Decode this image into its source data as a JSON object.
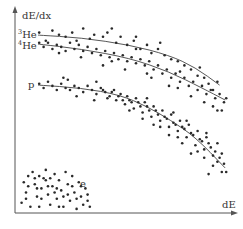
{
  "chart_data": {
    "type": "scatter",
    "title": "",
    "xlabel": "dE",
    "ylabel": "dE/dx",
    "xlim": [
      0,
      1
    ],
    "ylim": [
      0,
      1
    ],
    "grid": false,
    "legend": "none (inline labels at left)",
    "ticks": "none",
    "series": [
      {
        "name": "3He",
        "label_mass": "3",
        "label_elem": "He",
        "trend": [
          [
            0.105,
            0.868
          ],
          [
            0.3,
            0.855
          ],
          [
            0.52,
            0.82
          ],
          [
            0.7,
            0.77
          ],
          [
            0.82,
            0.71
          ],
          [
            0.93,
            0.624
          ]
        ],
        "points": [
          [
            0.11,
            0.88
          ],
          [
            0.14,
            0.84
          ],
          [
            0.17,
            0.89
          ],
          [
            0.2,
            0.87
          ],
          [
            0.23,
            0.86
          ],
          [
            0.26,
            0.88
          ],
          [
            0.28,
            0.84
          ],
          [
            0.31,
            0.9
          ],
          [
            0.34,
            0.85
          ],
          [
            0.36,
            0.87
          ],
          [
            0.4,
            0.86
          ],
          [
            0.42,
            0.88
          ],
          [
            0.46,
            0.83
          ],
          [
            0.48,
            0.86
          ],
          [
            0.51,
            0.82
          ],
          [
            0.54,
            0.84
          ],
          [
            0.57,
            0.8
          ],
          [
            0.6,
            0.82
          ],
          [
            0.62,
            0.78
          ],
          [
            0.65,
            0.8
          ],
          [
            0.68,
            0.77
          ],
          [
            0.71,
            0.75
          ],
          [
            0.74,
            0.74
          ],
          [
            0.77,
            0.72
          ],
          [
            0.8,
            0.7
          ],
          [
            0.83,
            0.67
          ],
          [
            0.86,
            0.66
          ],
          [
            0.88,
            0.63
          ],
          [
            0.9,
            0.6
          ],
          [
            0.55,
            0.86
          ],
          [
            0.66,
            0.83
          ],
          [
            0.44,
            0.9
          ],
          [
            0.75,
            0.69
          ],
          [
            0.84,
            0.71
          ],
          [
            0.92,
            0.64
          ]
        ]
      },
      {
        "name": "4He",
        "label_mass": "4",
        "label_elem": "He",
        "trend": [
          [
            0.105,
            0.824
          ],
          [
            0.3,
            0.8
          ],
          [
            0.52,
            0.756
          ],
          [
            0.7,
            0.69
          ],
          [
            0.85,
            0.61
          ],
          [
            0.955,
            0.551
          ]
        ],
        "points": [
          [
            0.11,
            0.83
          ],
          [
            0.13,
            0.81
          ],
          [
            0.15,
            0.83
          ],
          [
            0.17,
            0.8
          ],
          [
            0.19,
            0.82
          ],
          [
            0.21,
            0.81
          ],
          [
            0.23,
            0.79
          ],
          [
            0.25,
            0.83
          ],
          [
            0.27,
            0.8
          ],
          [
            0.29,
            0.82
          ],
          [
            0.31,
            0.79
          ],
          [
            0.33,
            0.81
          ],
          [
            0.35,
            0.78
          ],
          [
            0.37,
            0.8
          ],
          [
            0.39,
            0.77
          ],
          [
            0.41,
            0.79
          ],
          [
            0.43,
            0.76
          ],
          [
            0.45,
            0.78
          ],
          [
            0.47,
            0.75
          ],
          [
            0.49,
            0.77
          ],
          [
            0.51,
            0.74
          ],
          [
            0.53,
            0.76
          ],
          [
            0.55,
            0.73
          ],
          [
            0.57,
            0.75
          ],
          [
            0.59,
            0.72
          ],
          [
            0.61,
            0.74
          ],
          [
            0.63,
            0.7
          ],
          [
            0.65,
            0.72
          ],
          [
            0.67,
            0.68
          ],
          [
            0.69,
            0.7
          ],
          [
            0.71,
            0.66
          ],
          [
            0.73,
            0.68
          ],
          [
            0.75,
            0.64
          ],
          [
            0.77,
            0.66
          ],
          [
            0.79,
            0.62
          ],
          [
            0.81,
            0.64
          ],
          [
            0.83,
            0.6
          ],
          [
            0.85,
            0.62
          ],
          [
            0.87,
            0.58
          ],
          [
            0.89,
            0.6
          ],
          [
            0.91,
            0.56
          ],
          [
            0.93,
            0.58
          ],
          [
            0.95,
            0.54
          ],
          [
            0.94,
            0.5
          ],
          [
            0.9,
            0.52
          ],
          [
            0.7,
            0.62
          ],
          [
            0.6,
            0.68
          ],
          [
            0.5,
            0.7
          ],
          [
            0.4,
            0.72
          ],
          [
            0.22,
            0.66
          ],
          [
            0.55,
            0.8
          ],
          [
            0.8,
            0.57
          ],
          [
            0.86,
            0.54
          ],
          [
            0.96,
            0.56
          ],
          [
            0.62,
            0.66
          ],
          [
            0.74,
            0.61
          ],
          [
            0.44,
            0.74
          ],
          [
            0.3,
            0.76
          ],
          [
            0.2,
            0.78
          ],
          [
            0.92,
            0.5
          ]
        ]
      },
      {
        "name": "p",
        "label_mass": "",
        "label_elem": "p",
        "trend": [
          [
            0.105,
            0.624
          ],
          [
            0.3,
            0.61
          ],
          [
            0.477,
            0.576
          ],
          [
            0.6,
            0.52
          ],
          [
            0.705,
            0.454
          ],
          [
            0.82,
            0.37
          ],
          [
            0.955,
            0.22
          ]
        ],
        "points": [
          [
            0.11,
            0.63
          ],
          [
            0.13,
            0.61
          ],
          [
            0.15,
            0.64
          ],
          [
            0.17,
            0.62
          ],
          [
            0.19,
            0.6
          ],
          [
            0.21,
            0.63
          ],
          [
            0.23,
            0.61
          ],
          [
            0.25,
            0.6
          ],
          [
            0.27,
            0.62
          ],
          [
            0.29,
            0.61
          ],
          [
            0.31,
            0.59
          ],
          [
            0.33,
            0.62
          ],
          [
            0.35,
            0.6
          ],
          [
            0.37,
            0.58
          ],
          [
            0.39,
            0.61
          ],
          [
            0.41,
            0.59
          ],
          [
            0.43,
            0.57
          ],
          [
            0.45,
            0.6
          ],
          [
            0.47,
            0.57
          ],
          [
            0.49,
            0.55
          ],
          [
            0.51,
            0.57
          ],
          [
            0.53,
            0.54
          ],
          [
            0.55,
            0.56
          ],
          [
            0.57,
            0.52
          ],
          [
            0.59,
            0.54
          ],
          [
            0.61,
            0.5
          ],
          [
            0.63,
            0.52
          ],
          [
            0.65,
            0.48
          ],
          [
            0.67,
            0.5
          ],
          [
            0.69,
            0.46
          ],
          [
            0.71,
            0.48
          ],
          [
            0.73,
            0.43
          ],
          [
            0.75,
            0.45
          ],
          [
            0.77,
            0.41
          ],
          [
            0.79,
            0.43
          ],
          [
            0.81,
            0.38
          ],
          [
            0.83,
            0.4
          ],
          [
            0.85,
            0.35
          ],
          [
            0.87,
            0.37
          ],
          [
            0.89,
            0.32
          ],
          [
            0.91,
            0.3
          ],
          [
            0.93,
            0.27
          ],
          [
            0.95,
            0.24
          ],
          [
            0.94,
            0.2
          ],
          [
            0.92,
            0.25
          ],
          [
            0.9,
            0.28
          ],
          [
            0.88,
            0.34
          ],
          [
            0.86,
            0.31
          ],
          [
            0.84,
            0.36
          ],
          [
            0.82,
            0.33
          ],
          [
            0.8,
            0.39
          ],
          [
            0.78,
            0.37
          ],
          [
            0.76,
            0.42
          ],
          [
            0.74,
            0.4
          ],
          [
            0.72,
            0.44
          ],
          [
            0.7,
            0.42
          ],
          [
            0.68,
            0.47
          ],
          [
            0.66,
            0.45
          ],
          [
            0.64,
            0.5
          ],
          [
            0.62,
            0.47
          ],
          [
            0.6,
            0.52
          ],
          [
            0.58,
            0.49
          ],
          [
            0.56,
            0.54
          ],
          [
            0.54,
            0.51
          ],
          [
            0.52,
            0.55
          ],
          [
            0.5,
            0.53
          ],
          [
            0.48,
            0.58
          ],
          [
            0.46,
            0.55
          ],
          [
            0.44,
            0.59
          ],
          [
            0.42,
            0.56
          ],
          [
            0.4,
            0.6
          ],
          [
            0.36,
            0.55
          ],
          [
            0.28,
            0.57
          ],
          [
            0.7,
            0.38
          ],
          [
            0.76,
            0.34
          ],
          [
            0.8,
            0.29
          ],
          [
            0.86,
            0.27
          ],
          [
            0.9,
            0.23
          ],
          [
            0.96,
            0.2
          ],
          [
            0.88,
            0.19
          ],
          [
            0.83,
            0.3
          ],
          [
            0.74,
            0.37
          ],
          [
            0.66,
            0.42
          ],
          [
            0.58,
            0.46
          ],
          [
            0.52,
            0.5
          ],
          [
            0.24,
            0.65
          ],
          [
            0.37,
            0.64
          ],
          [
            0.6,
            0.56
          ],
          [
            0.63,
            0.43
          ],
          [
            0.92,
            0.34
          ],
          [
            0.94,
            0.29
          ],
          [
            0.87,
            0.39
          ],
          [
            0.72,
            0.49
          ],
          [
            0.78,
            0.45
          ]
        ]
      },
      {
        "name": "e",
        "label_mass": "",
        "label_elem": "e",
        "trend": [],
        "points": [
          [
            0.03,
            0.05
          ],
          [
            0.05,
            0.1
          ],
          [
            0.04,
            0.15
          ],
          [
            0.06,
            0.18
          ],
          [
            0.08,
            0.2
          ],
          [
            0.09,
            0.14
          ],
          [
            0.1,
            0.08
          ],
          [
            0.11,
            0.03
          ],
          [
            0.12,
            0.12
          ],
          [
            0.13,
            0.17
          ],
          [
            0.14,
            0.21
          ],
          [
            0.15,
            0.09
          ],
          [
            0.16,
            0.04
          ],
          [
            0.17,
            0.13
          ],
          [
            0.18,
            0.19
          ],
          [
            0.19,
            0.07
          ],
          [
            0.2,
            0.16
          ],
          [
            0.21,
            0.11
          ],
          [
            0.22,
            0.03
          ],
          [
            0.23,
            0.2
          ],
          [
            0.24,
            0.14
          ],
          [
            0.25,
            0.06
          ],
          [
            0.26,
            0.18
          ],
          [
            0.27,
            0.1
          ],
          [
            0.28,
            0.02
          ],
          [
            0.29,
            0.15
          ],
          [
            0.3,
            0.08
          ],
          [
            0.31,
            0.04
          ],
          [
            0.32,
            0.12
          ],
          [
            0.33,
            0.06
          ],
          [
            0.34,
            0.03
          ],
          [
            0.07,
            0.03
          ],
          [
            0.05,
            0.07
          ],
          [
            0.09,
            0.17
          ],
          [
            0.12,
            0.07
          ],
          [
            0.16,
            0.17
          ],
          [
            0.2,
            0.03
          ],
          [
            0.22,
            0.08
          ],
          [
            0.24,
            0.09
          ],
          [
            0.18,
            0.1
          ],
          [
            0.14,
            0.16
          ],
          [
            0.1,
            0.12
          ],
          [
            0.06,
            0.13
          ],
          [
            0.26,
            0.13
          ],
          [
            0.3,
            0.13
          ],
          [
            0.28,
            0.07
          ],
          [
            0.33,
            0.09
          ],
          [
            0.15,
            0.13
          ],
          [
            0.19,
            0.12
          ],
          [
            0.11,
            0.18
          ]
        ]
      }
    ]
  }
}
